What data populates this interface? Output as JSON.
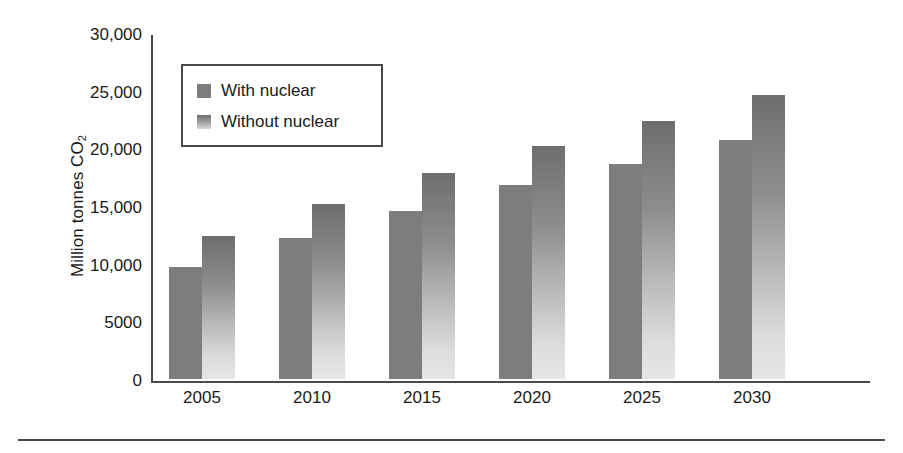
{
  "chart_data": {
    "type": "bar",
    "title": "",
    "xlabel": "",
    "ylabel": "Million tonnes CO2",
    "ylabel_parts": {
      "text": "Million tonnes CO",
      "subscript": "2"
    },
    "categories": [
      "2005",
      "2010",
      "2015",
      "2020",
      "2025",
      "2030"
    ],
    "series": [
      {
        "name": "With nuclear",
        "values": [
          9700,
          12200,
          14600,
          16800,
          18600,
          20700
        ],
        "color": "#7d7d7d",
        "fill": "solid"
      },
      {
        "name": "Without nuclear",
        "values": [
          12400,
          15200,
          17900,
          20200,
          22400,
          24600
        ],
        "color": "#6e6e6e",
        "fill": "gradient-dark-to-light"
      }
    ],
    "ylim": [
      0,
      30000
    ],
    "ytick_values": [
      0,
      5000,
      10000,
      15000,
      20000,
      25000,
      30000
    ],
    "ytick_labels": [
      "0",
      "5000",
      "10,000",
      "15,000",
      "20,000",
      "25,000",
      "30,000"
    ],
    "grid": false,
    "legend_position": "upper-left-inside",
    "legend_entries": [
      "With nuclear",
      "Without nuclear"
    ]
  },
  "legend": {
    "items": [
      {
        "label": "With nuclear",
        "swatch": "solid-gray-swatch"
      },
      {
        "label": "Without nuclear",
        "swatch": "gradient-gray-swatch"
      }
    ]
  },
  "axes": {
    "y_title": "Million tonnes CO",
    "y_title_subscript": "2",
    "y_ticks": [
      "30,000",
      "25,000",
      "20,000",
      "15,000",
      "10,000",
      "5000",
      "0"
    ],
    "x_ticks": [
      "2005",
      "2010",
      "2015",
      "2020",
      "2025",
      "2030"
    ]
  },
  "colors": {
    "axis": "#4a4a4a",
    "text": "#1a1a1a",
    "with_nuclear": "#7d7d7d",
    "without_nuclear_top": "#6e6e6e",
    "without_nuclear_bottom": "#e6e6e6",
    "background": "#ffffff"
  }
}
